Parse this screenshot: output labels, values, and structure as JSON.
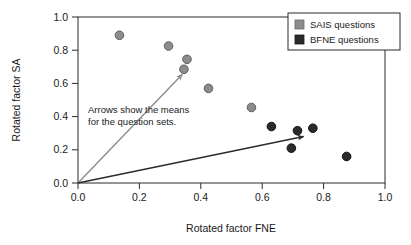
{
  "chart_data": {
    "type": "scatter",
    "title": "",
    "xlabel": "Rotated factor FNE",
    "ylabel": "Rotated factor SA",
    "xlim": [
      0.0,
      1.0
    ],
    "ylim": [
      0.0,
      1.0
    ],
    "grid": false,
    "xticks": [
      "0.0",
      "0.2",
      "0.4",
      "0.6",
      "0.8",
      "1.0"
    ],
    "xtick_values": [
      0.0,
      0.2,
      0.4,
      0.6,
      0.8,
      1.0
    ],
    "yticks": [
      "0.0",
      "0.2",
      "0.4",
      "0.6",
      "0.8",
      "1.0"
    ],
    "ytick_values": [
      0.0,
      0.2,
      0.4,
      0.6,
      0.8,
      1.0
    ],
    "legend_position": "top-right",
    "legend": [
      {
        "label": "SAIS questions",
        "color": "#8c8c8c"
      },
      {
        "label": "BFNE questions",
        "color": "#2b2b2b"
      }
    ],
    "series": [
      {
        "name": "SAIS questions",
        "color": "#8c8c8c",
        "marker": "circle",
        "points": [
          {
            "x": 0.135,
            "y": 0.89
          },
          {
            "x": 0.295,
            "y": 0.825
          },
          {
            "x": 0.355,
            "y": 0.745
          },
          {
            "x": 0.345,
            "y": 0.685
          },
          {
            "x": 0.425,
            "y": 0.57
          },
          {
            "x": 0.565,
            "y": 0.455
          }
        ]
      },
      {
        "name": "BFNE questions",
        "color": "#2b2b2b",
        "marker": "circle",
        "points": [
          {
            "x": 0.63,
            "y": 0.34
          },
          {
            "x": 0.715,
            "y": 0.315
          },
          {
            "x": 0.765,
            "y": 0.33
          },
          {
            "x": 0.695,
            "y": 0.21
          },
          {
            "x": 0.875,
            "y": 0.16
          }
        ]
      }
    ],
    "annotations": [
      {
        "name": "mean-arrow-sais",
        "type": "arrow",
        "color": "#8c8c8c",
        "from": {
          "x": 0.0,
          "y": 0.0
        },
        "to": {
          "x": 0.34,
          "y": 0.655
        }
      },
      {
        "name": "mean-arrow-bfne",
        "type": "arrow",
        "color": "#2b2b2b",
        "from": {
          "x": 0.0,
          "y": 0.0
        },
        "to": {
          "x": 0.735,
          "y": 0.28
        }
      }
    ],
    "note_line1": "Arrows show the means",
    "note_line2": "for the question sets."
  }
}
